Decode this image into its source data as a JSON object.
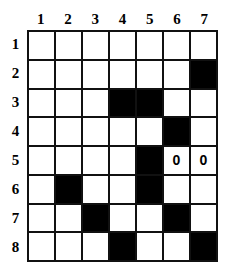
{
  "figure": {
    "kind": "grid-puzzle",
    "columns": 7,
    "rows": 8,
    "colors": {
      "filled": "#000000",
      "empty": "#ffffff",
      "line": "#111111",
      "text": "#000000"
    }
  },
  "column_headers": [
    "1",
    "2",
    "3",
    "4",
    "5",
    "6",
    "7"
  ],
  "row_headers": [
    "1",
    "2",
    "3",
    "4",
    "5",
    "6",
    "7",
    "8"
  ],
  "grid": {
    "cells": [
      [
        {
          "state": "empty",
          "mark": ""
        },
        {
          "state": "empty",
          "mark": ""
        },
        {
          "state": "empty",
          "mark": ""
        },
        {
          "state": "empty",
          "mark": ""
        },
        {
          "state": "empty",
          "mark": ""
        },
        {
          "state": "empty",
          "mark": ""
        },
        {
          "state": "empty",
          "mark": ""
        }
      ],
      [
        {
          "state": "empty",
          "mark": ""
        },
        {
          "state": "empty",
          "mark": ""
        },
        {
          "state": "empty",
          "mark": ""
        },
        {
          "state": "empty",
          "mark": ""
        },
        {
          "state": "empty",
          "mark": ""
        },
        {
          "state": "empty",
          "mark": ""
        },
        {
          "state": "filled",
          "mark": ""
        }
      ],
      [
        {
          "state": "empty",
          "mark": ""
        },
        {
          "state": "empty",
          "mark": ""
        },
        {
          "state": "empty",
          "mark": ""
        },
        {
          "state": "filled",
          "mark": ""
        },
        {
          "state": "filled",
          "mark": ""
        },
        {
          "state": "empty",
          "mark": ""
        },
        {
          "state": "empty",
          "mark": ""
        }
      ],
      [
        {
          "state": "empty",
          "mark": ""
        },
        {
          "state": "empty",
          "mark": ""
        },
        {
          "state": "empty",
          "mark": ""
        },
        {
          "state": "empty",
          "mark": ""
        },
        {
          "state": "empty",
          "mark": ""
        },
        {
          "state": "filled",
          "mark": ""
        },
        {
          "state": "empty",
          "mark": ""
        }
      ],
      [
        {
          "state": "empty",
          "mark": ""
        },
        {
          "state": "empty",
          "mark": ""
        },
        {
          "state": "empty",
          "mark": ""
        },
        {
          "state": "empty",
          "mark": ""
        },
        {
          "state": "filled",
          "mark": ""
        },
        {
          "state": "empty",
          "mark": "0"
        },
        {
          "state": "empty",
          "mark": "0"
        }
      ],
      [
        {
          "state": "empty",
          "mark": ""
        },
        {
          "state": "filled",
          "mark": ""
        },
        {
          "state": "empty",
          "mark": ""
        },
        {
          "state": "empty",
          "mark": ""
        },
        {
          "state": "filled",
          "mark": ""
        },
        {
          "state": "empty",
          "mark": ""
        },
        {
          "state": "empty",
          "mark": ""
        }
      ],
      [
        {
          "state": "empty",
          "mark": ""
        },
        {
          "state": "empty",
          "mark": ""
        },
        {
          "state": "filled",
          "mark": ""
        },
        {
          "state": "empty",
          "mark": ""
        },
        {
          "state": "empty",
          "mark": ""
        },
        {
          "state": "filled",
          "mark": ""
        },
        {
          "state": "empty",
          "mark": ""
        }
      ],
      [
        {
          "state": "empty",
          "mark": ""
        },
        {
          "state": "empty",
          "mark": ""
        },
        {
          "state": "empty",
          "mark": ""
        },
        {
          "state": "filled",
          "mark": ""
        },
        {
          "state": "empty",
          "mark": ""
        },
        {
          "state": "empty",
          "mark": ""
        },
        {
          "state": "filled",
          "mark": ""
        }
      ]
    ]
  }
}
